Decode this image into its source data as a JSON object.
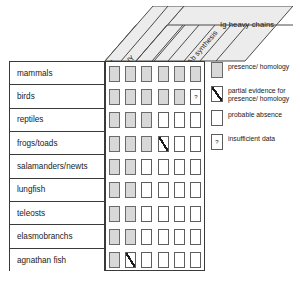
{
  "figure": {
    "header": {
      "group_label": "Ig heavy chains",
      "first_column_label": "Ab synthesis",
      "chain_labels": [
        "M",
        "G/Y",
        "A",
        "D",
        "E"
      ]
    },
    "columns": [
      "Ab synthesis",
      "M",
      "G/Y",
      "A",
      "D",
      "E"
    ],
    "rows": [
      {
        "label": "mammals",
        "cells": [
          "present",
          "present",
          "present",
          "present",
          "present",
          "present"
        ]
      },
      {
        "label": "birds",
        "cells": [
          "present",
          "present",
          "present",
          "present",
          "present",
          "unknown"
        ]
      },
      {
        "label": "reptiles",
        "cells": [
          "present",
          "present",
          "present",
          "absent",
          "absent",
          "absent"
        ]
      },
      {
        "label": "frogs/toads",
        "cells": [
          "present",
          "present",
          "present",
          "partial",
          "absent",
          "absent"
        ]
      },
      {
        "label": "salamanders/newts",
        "cells": [
          "present",
          "present",
          "absent",
          "absent",
          "absent",
          "absent"
        ]
      },
      {
        "label": "lungfish",
        "cells": [
          "present",
          "present",
          "absent",
          "absent",
          "absent",
          "absent"
        ]
      },
      {
        "label": "teleosts",
        "cells": [
          "present",
          "present",
          "absent",
          "absent",
          "absent",
          "absent"
        ]
      },
      {
        "label": "elasmobranchs",
        "cells": [
          "present",
          "present",
          "absent",
          "absent",
          "absent",
          "absent"
        ]
      },
      {
        "label": "agnathan fish",
        "cells": [
          "present",
          "partial",
          "absent",
          "absent",
          "absent",
          "absent"
        ]
      }
    ],
    "legend": [
      {
        "state": "present",
        "text": "presence/ homology"
      },
      {
        "state": "partial",
        "text": "partial evidence for\npresence/ homology"
      },
      {
        "state": "absent",
        "text": "probable absence"
      },
      {
        "state": "unknown",
        "text": "insufficient data"
      }
    ],
    "colors": {
      "present_fill": "#d8d8d8",
      "absent_fill": "#ffffff",
      "line": "#3a3a3a",
      "cell_border": "#5d5d5d",
      "text": "#1a1a1a",
      "banner_fill": "#ececec"
    }
  }
}
